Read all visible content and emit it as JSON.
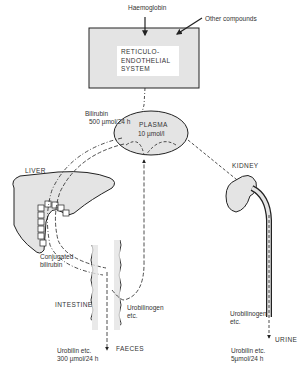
{
  "diagram": {
    "inputs": {
      "haemoglobin": "Haemoglobin",
      "other": "Other compounds"
    },
    "res_system": [
      "RETICULO-",
      "ENDOTHELIAL",
      "SYSTEM"
    ],
    "bilirubin": {
      "label": "Bilirubin",
      "rate": "500 µmol/24 h"
    },
    "plasma": {
      "label": "PLASMA",
      "conc": "10 µmol/l"
    },
    "liver": "LIVER",
    "kidney": "KIDNEY",
    "conjugated": [
      "Conjugated",
      "bilirubin"
    ],
    "intestine": "INTESTINE",
    "urobilinogen_gut": [
      "Urobilinogen",
      "etc."
    ],
    "urobilinogen_kidney": [
      "Urobilinogen",
      "etc."
    ],
    "faeces": {
      "label": "FAECES",
      "note": [
        "Urobilin etc.",
        "300 µmol/24 h"
      ]
    },
    "urine": {
      "label": "URINE",
      "note": [
        "Urobilin etc.",
        "5µmol/24 h"
      ]
    },
    "colors": {
      "fill": "#e4e4e4",
      "stroke": "#222222"
    }
  }
}
